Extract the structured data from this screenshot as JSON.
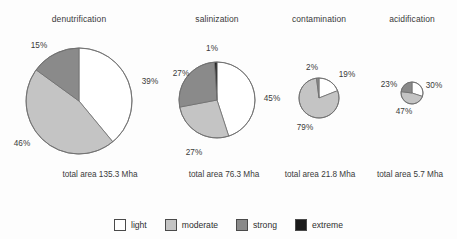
{
  "figure": {
    "background": "#fdfdfd",
    "text_color": "#3a3a3a"
  },
  "legend": {
    "position": "bottom-center",
    "items": [
      {
        "label": "light",
        "color": "#ffffff"
      },
      {
        "label": "moderate",
        "color": "#c4c4c4"
      },
      {
        "label": "strong",
        "color": "#8a8a8a"
      },
      {
        "label": "extreme",
        "color": "#1a1a1a"
      }
    ]
  },
  "chart_data": [
    {
      "type": "pie",
      "title": "denutrification",
      "subtitle": "total area 135.3 Mha",
      "total_area_mha": 135.3,
      "categories": [
        "light",
        "moderate",
        "strong",
        "extreme"
      ],
      "values": [
        39,
        46,
        15,
        0
      ],
      "labels": [
        "39%",
        "46%",
        "15%",
        ""
      ],
      "colors": [
        "#ffffff",
        "#c4c4c4",
        "#8a8a8a",
        "#1a1a1a"
      ],
      "center": [
        79,
        101
      ],
      "radius": 53,
      "start_angle": 0,
      "direction": "clockwise",
      "label_positions": [
        {
          "text": "39%",
          "x": 150,
          "y": 81
        },
        {
          "text": "46%",
          "x": 22,
          "y": 143
        },
        {
          "text": "15%",
          "x": 39,
          "y": 45
        }
      ]
    },
    {
      "type": "pie",
      "title": "salinization",
      "subtitle": "total area 76.3 Mha",
      "total_area_mha": 76.3,
      "categories": [
        "light",
        "moderate",
        "strong",
        "extreme"
      ],
      "values": [
        45,
        27,
        27,
        1
      ],
      "labels": [
        "45%",
        "27%",
        "27%",
        "1%"
      ],
      "colors": [
        "#ffffff",
        "#c4c4c4",
        "#8a8a8a",
        "#1a1a1a"
      ],
      "center": [
        217,
        100
      ],
      "radius": 38,
      "start_angle": 0,
      "direction": "clockwise",
      "label_positions": [
        {
          "text": "45%",
          "x": 272,
          "y": 98
        },
        {
          "text": "27%",
          "x": 194,
          "y": 152
        },
        {
          "text": "27%",
          "x": 181,
          "y": 73
        },
        {
          "text": "1%",
          "x": 212,
          "y": 48
        }
      ]
    },
    {
      "type": "pie",
      "title": "contamination",
      "subtitle": "total area 21.8 Mha",
      "total_area_mha": 21.8,
      "categories": [
        "light",
        "moderate",
        "strong",
        "extreme"
      ],
      "values": [
        19,
        79,
        2,
        0
      ],
      "labels": [
        "19%",
        "79%",
        "2%",
        ""
      ],
      "colors": [
        "#ffffff",
        "#c4c4c4",
        "#8a8a8a",
        "#1a1a1a"
      ],
      "center": [
        319,
        98
      ],
      "radius": 20,
      "start_angle": 0,
      "direction": "clockwise",
      "label_positions": [
        {
          "text": "19%",
          "x": 347,
          "y": 74
        },
        {
          "text": "79%",
          "x": 305,
          "y": 127
        },
        {
          "text": "2%",
          "x": 312,
          "y": 67
        }
      ]
    },
    {
      "type": "pie",
      "title": "acidification",
      "subtitle": "total area 5.7 Mha",
      "total_area_mha": 5.7,
      "categories": [
        "light",
        "moderate",
        "strong",
        "extreme"
      ],
      "values": [
        30,
        47,
        23,
        0
      ],
      "labels": [
        "30%",
        "47%",
        "23%",
        ""
      ],
      "colors": [
        "#ffffff",
        "#c4c4c4",
        "#8a8a8a",
        "#1a1a1a"
      ],
      "center": [
        412,
        93
      ],
      "radius": 11,
      "start_angle": 0,
      "direction": "clockwise",
      "label_positions": [
        {
          "text": "30%",
          "x": 434,
          "y": 85
        },
        {
          "text": "47%",
          "x": 404,
          "y": 111
        },
        {
          "text": "23%",
          "x": 389,
          "y": 84
        }
      ]
    }
  ],
  "panel_layout": [
    {
      "title_x": 79,
      "title_y": 14,
      "total_x": 100,
      "total_y": 170
    },
    {
      "title_x": 217,
      "title_y": 14,
      "total_x": 224,
      "total_y": 170
    },
    {
      "title_x": 319,
      "title_y": 14,
      "total_x": 320,
      "total_y": 170
    },
    {
      "title_x": 412,
      "title_y": 14,
      "total_x": 410,
      "total_y": 170
    }
  ]
}
